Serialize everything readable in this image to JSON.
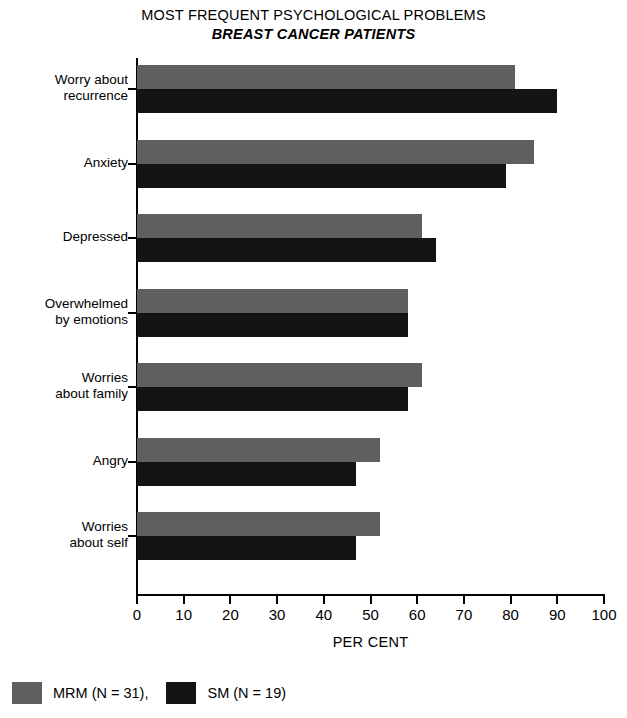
{
  "chart_data": {
    "type": "bar",
    "orientation": "horizontal",
    "title": "MOST FREQUENT PSYCHOLOGICAL PROBLEMS",
    "subtitle": "BREAST CANCER PATIENTS",
    "xlabel": "PER CENT",
    "ylabel": "",
    "xlim": [
      0,
      100
    ],
    "xticks": [
      "0",
      "10",
      "20",
      "30",
      "40",
      "50",
      "60",
      "70",
      "80",
      "90",
      "100"
    ],
    "grid": false,
    "legend_position": "bottom-left",
    "categories": [
      "Worry about recurrence",
      "Anxiety",
      "Depressed",
      "Overwhelmed by emotions",
      "Worries about family",
      "Angry",
      "Worries about self"
    ],
    "category_label_lines": [
      [
        "Worry about",
        "recurrence"
      ],
      [
        "Anxiety"
      ],
      [
        "Depressed"
      ],
      [
        "Overwhelmed",
        "by emotions"
      ],
      [
        "Worries",
        "about family"
      ],
      [
        "Angry"
      ],
      [
        "Worries",
        "about self"
      ]
    ],
    "series": [
      {
        "name": "MRM (N = 31),",
        "key": "mrm",
        "color": "#5f5f5f",
        "values": [
          81,
          85,
          61,
          58,
          61,
          52,
          52
        ]
      },
      {
        "name": "SM (N = 19)",
        "key": "sm",
        "color": "#141414",
        "values": [
          90,
          79,
          64,
          58,
          58,
          47,
          47
        ]
      }
    ]
  },
  "legend": {
    "items": [
      {
        "label": "MRM (N = 31),",
        "swatch": "mrm"
      },
      {
        "label": "SM (N = 19)",
        "swatch": "sm"
      }
    ]
  }
}
